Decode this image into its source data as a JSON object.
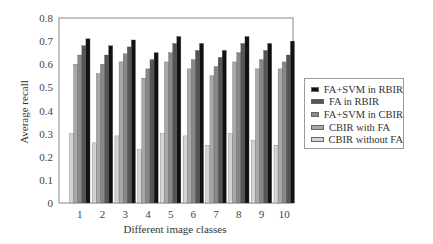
{
  "chart_data": {
    "type": "bar",
    "title": "",
    "xlabel": "Different image classes",
    "ylabel": "Average recall",
    "ylim": [
      0,
      0.8
    ],
    "yticks": [
      "0",
      "0.1",
      "0.2",
      "0.3",
      "0.4",
      "0.5",
      "0.6",
      "0.7",
      "0.8"
    ],
    "grid": false,
    "legend_position": "right",
    "categories": [
      "1",
      "2",
      "3",
      "4",
      "5",
      "6",
      "7",
      "8",
      "9",
      "10"
    ],
    "series": [
      {
        "name": "CBIR without FA",
        "color": "#d4d4d4",
        "values": [
          0.3,
          0.26,
          0.29,
          0.23,
          0.3,
          0.29,
          0.25,
          0.3,
          0.27,
          0.25
        ]
      },
      {
        "name": "CBIR with FA",
        "color": "#a8a8a8",
        "values": [
          0.6,
          0.56,
          0.61,
          0.54,
          0.61,
          0.58,
          0.55,
          0.61,
          0.58,
          0.58
        ]
      },
      {
        "name": "FA+SVM in CBIR",
        "color": "#888888",
        "values": [
          0.64,
          0.6,
          0.645,
          0.58,
          0.65,
          0.62,
          0.59,
          0.65,
          0.62,
          0.61
        ]
      },
      {
        "name": "FA in RBIR",
        "color": "#555555",
        "values": [
          0.68,
          0.64,
          0.675,
          0.62,
          0.69,
          0.66,
          0.63,
          0.69,
          0.66,
          0.64
        ]
      },
      {
        "name": "FA+SVM in RBIR",
        "color": "#111111",
        "values": [
          0.71,
          0.68,
          0.705,
          0.65,
          0.72,
          0.69,
          0.66,
          0.72,
          0.69,
          0.7
        ]
      }
    ]
  },
  "legend": {
    "items": [
      {
        "label": "FA+SVM in RBIR",
        "color": "#111111"
      },
      {
        "label": "FA in RBIR",
        "color": "#555555"
      },
      {
        "label": "FA+SVM in CBIR",
        "color": "#888888"
      },
      {
        "label": "CBIR with FA",
        "color": "#a8a8a8"
      },
      {
        "label": "CBIR without FA",
        "color": "#d4d4d4"
      }
    ]
  }
}
